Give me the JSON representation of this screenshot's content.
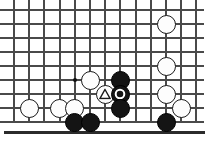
{
  "diagram": {
    "type": "go-board-diagram",
    "board": {
      "columns": 13,
      "rows": 9,
      "cell_width": 15.2,
      "cell_height": 14,
      "origin_x": 14,
      "origin_y": 10,
      "line_color": "#4a4a4a",
      "edge_color": "#2b2b2b",
      "background_color": "#ffffff",
      "bottom_edge_is_board_border": true,
      "bottom_edge_y": 131
    },
    "star_points": [
      {
        "name": "hoshi-star-point",
        "col": 4,
        "row": 5
      }
    ],
    "stones": [
      {
        "id": "white-1",
        "color": "white",
        "col": 1,
        "row": 7,
        "mark": "none"
      },
      {
        "id": "white-2",
        "color": "white",
        "col": 3,
        "row": 7,
        "mark": "none"
      },
      {
        "id": "white-3",
        "color": "white",
        "col": 4,
        "row": 7,
        "mark": "none"
      },
      {
        "id": "white-4",
        "color": "white",
        "col": 5,
        "row": 5,
        "mark": "none"
      },
      {
        "id": "white-5",
        "color": "white",
        "col": 6,
        "row": 6,
        "mark": "triangle"
      },
      {
        "id": "white-6",
        "color": "white",
        "col": 10,
        "row": 1,
        "mark": "none"
      },
      {
        "id": "white-7",
        "color": "white",
        "col": 10,
        "row": 4,
        "mark": "none"
      },
      {
        "id": "white-8",
        "color": "white",
        "col": 10,
        "row": 6,
        "mark": "none"
      },
      {
        "id": "white-9",
        "color": "white",
        "col": 11,
        "row": 7,
        "mark": "none"
      },
      {
        "id": "black-1",
        "color": "black",
        "col": 4,
        "row": 8,
        "mark": "none"
      },
      {
        "id": "black-2",
        "color": "black",
        "col": 5,
        "row": 8,
        "mark": "none"
      },
      {
        "id": "black-3",
        "color": "black",
        "col": 7,
        "row": 5,
        "mark": "none"
      },
      {
        "id": "black-4",
        "color": "black",
        "col": 7,
        "row": 6,
        "mark": "circle"
      },
      {
        "id": "black-5",
        "color": "black",
        "col": 7,
        "row": 7,
        "mark": "none"
      },
      {
        "id": "black-6",
        "color": "black",
        "col": 10,
        "row": 8,
        "mark": "none"
      }
    ],
    "marks": {
      "triangle": {
        "label": "triangle-mark",
        "color": "#1a1a1a",
        "on_stone": "white-5"
      },
      "circle": {
        "label": "circle-mark",
        "color": "#ffffff",
        "on_stone": "black-4"
      }
    }
  }
}
